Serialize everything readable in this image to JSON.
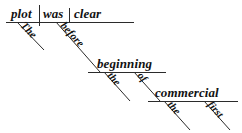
{
  "diagram": {
    "type": "reed-kellogg-sentence-diagram",
    "sentence": "The plot was clear before the beginning of the first commercial.",
    "background_color": "#ffffff",
    "ink_color": "#2b2b2b",
    "baselines": [
      {
        "name": "main-clause-baseline",
        "x1": 6,
        "y1": 22,
        "x2": 134,
        "y2": 22
      },
      {
        "name": "beginning-baseline",
        "x1": 88,
        "y1": 72,
        "x2": 166,
        "y2": 72
      },
      {
        "name": "commercial-baseline",
        "x1": 148,
        "y1": 101,
        "x2": 238,
        "y2": 101
      }
    ],
    "dividers": [
      {
        "name": "subject-verb-divider",
        "x": 39,
        "y1": 5,
        "y2": 26
      },
      {
        "name": "verb-complement-divider",
        "x": 69,
        "y1": 8,
        "y2": 22
      }
    ],
    "main_line": {
      "subject": {
        "label": "plot",
        "x": 11,
        "y": 18
      },
      "verb": {
        "label": "was",
        "x": 43,
        "y": 18
      },
      "complement": {
        "label": "clear",
        "x": 74,
        "y": 18
      }
    },
    "modifiers": [
      {
        "label": "The",
        "name": "modifier-the-plot",
        "attaches_to": "plot",
        "slant": {
          "x1": 17,
          "y1": 22,
          "x2": 44,
          "y2": 50
        },
        "text_anchor": {
          "x": 20,
          "y": 26
        },
        "rotation": 46,
        "size": "w-mod"
      },
      {
        "label": "before",
        "name": "modifier-before",
        "attaches_to": "was",
        "slant": {
          "x1": 56,
          "y1": 22,
          "x2": 100,
          "y2": 72
        },
        "text_anchor": {
          "x": 60,
          "y": 26
        },
        "rotation": 48,
        "size": "w-mod"
      },
      {
        "label": "beginning",
        "name": "object-beginning",
        "attaches_to": "before",
        "x": 97,
        "y": 68
      },
      {
        "label": "the",
        "name": "modifier-the-beginning",
        "attaches_to": "beginning",
        "slant": {
          "x1": 104,
          "y1": 72,
          "x2": 130,
          "y2": 101
        },
        "text_anchor": {
          "x": 107,
          "y": 76
        },
        "rotation": 48,
        "size": "w-small"
      },
      {
        "label": "of",
        "name": "preposition-of",
        "attaches_to": "beginning",
        "slant": {
          "x1": 134,
          "y1": 72,
          "x2": 160,
          "y2": 101
        },
        "text_anchor": {
          "x": 137,
          "y": 76
        },
        "rotation": 48,
        "size": "w-small"
      },
      {
        "label": "commercial",
        "name": "object-commercial",
        "attaches_to": "of",
        "x": 155,
        "y": 97
      },
      {
        "label": "the",
        "name": "modifier-the-commercial",
        "attaches_to": "commercial",
        "slant": {
          "x1": 164,
          "y1": 101,
          "x2": 190,
          "y2": 130
        },
        "text_anchor": {
          "x": 167,
          "y": 105
        },
        "rotation": 48,
        "size": "w-small"
      },
      {
        "label": "first",
        "name": "modifier-first",
        "attaches_to": "commercial",
        "slant": {
          "x1": 204,
          "y1": 101,
          "x2": 230,
          "y2": 130
        },
        "text_anchor": {
          "x": 207,
          "y": 105
        },
        "rotation": 48,
        "size": "w-small"
      }
    ]
  }
}
